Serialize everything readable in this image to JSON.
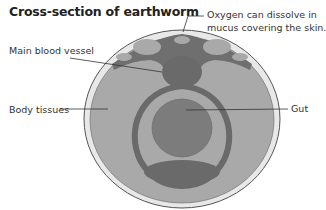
{
  "title": "Cross-section of earthworm",
  "labels": {
    "oxygen_line1": "Oxygen can dissolve in",
    "oxygen_line2": "mucus covering the skin.",
    "blood_vessel": "Main blood vessel",
    "body_tissues": "Body tissues",
    "gut": "Gut"
  },
  "colors": {
    "skin": "#e6e6e6",
    "tissue": "#a8a8a8",
    "vessel": "#6e6e6e",
    "gut": "#7c7c7c",
    "outline": "#555555"
  }
}
